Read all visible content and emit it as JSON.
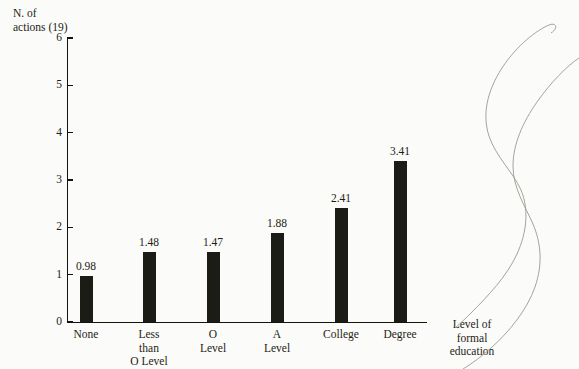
{
  "chart_data": {
    "type": "bar",
    "title": "",
    "subtitle": "",
    "xlabel": "Level of\nformal\neducation",
    "ylabel": "N. of\nactions (19)",
    "categories": [
      "None",
      "Less\nthan\nO Level",
      "O\nLevel",
      "A\nLevel",
      "College",
      "Degree"
    ],
    "values": [
      0.98,
      1.48,
      1.47,
      1.88,
      2.41,
      3.41
    ],
    "value_labels": [
      "0.98",
      "1.48",
      "1.47",
      "1.88",
      "2.41",
      "3.41"
    ],
    "ylim": [
      0,
      6
    ],
    "ytick_labels": [
      "0",
      "1",
      "2",
      "3",
      "4",
      "5",
      "6"
    ],
    "ytick_values": [
      0,
      1,
      2,
      3,
      4,
      5,
      6
    ],
    "grid": false,
    "legend": false,
    "legend_position": "none",
    "bar_color": "#1c1c16",
    "axis_color": "#14140d",
    "background_color": "#fbfbf9",
    "text_color": "#1d1d15"
  }
}
